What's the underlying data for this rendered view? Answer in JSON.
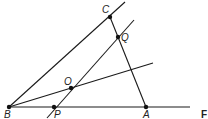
{
  "diagram": {
    "type": "geometry",
    "points": [
      {
        "id": "B",
        "label": "B",
        "x": 9,
        "y": 107
      },
      {
        "id": "P",
        "label": "P",
        "x": 54,
        "y": 107
      },
      {
        "id": "A",
        "label": "A",
        "x": 146,
        "y": 107
      },
      {
        "id": "C",
        "label": "C",
        "x": 110,
        "y": 17
      },
      {
        "id": "Q",
        "label": "Q",
        "x": 118,
        "y": 37
      },
      {
        "id": "O",
        "label": "O",
        "x": 71,
        "y": 88
      }
    ],
    "lines": [
      {
        "from": "B",
        "to": "base-end",
        "desc": "ray BA"
      },
      {
        "from": "B",
        "to": "C",
        "desc": "ray BC"
      },
      {
        "from": "C",
        "to": "A",
        "desc": "segment CA"
      },
      {
        "from": "P",
        "to": "Q",
        "desc": "line PQ through O"
      },
      {
        "from": "B",
        "to": "O",
        "desc": "ray BO"
      }
    ],
    "labels": {
      "B": "B",
      "P": "P",
      "A": "A",
      "C": "C",
      "Q": "Q",
      "O": "O",
      "F": "F"
    }
  }
}
